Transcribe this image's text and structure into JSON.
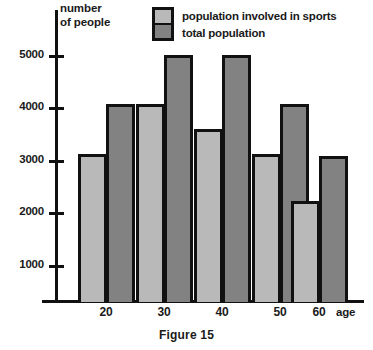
{
  "chart_data": {
    "type": "bar",
    "title": "",
    "caption": "Figure 15",
    "xlabel": "age",
    "ylabel": "number\nof people",
    "ylabel_line1": "number",
    "ylabel_line2": "of people",
    "categories": [
      "20",
      "30",
      "40",
      "50",
      "60"
    ],
    "yticks": [
      "1000",
      "2000",
      "3000",
      "4000",
      "5000"
    ],
    "ylim": [
      0,
      5600
    ],
    "grid": false,
    "legend_position": "top-center",
    "series": [
      {
        "name": "population involved in sports",
        "color": "#b9b9b9",
        "values": [
          3000,
          4000,
          3500,
          3000,
          2050
        ]
      },
      {
        "name": "total population",
        "color": "#828282",
        "values": [
          4000,
          5000,
          5000,
          4000,
          2950
        ]
      }
    ]
  },
  "legend": {
    "items": [
      {
        "label": "population involved in sports",
        "swatch": "light-gray"
      },
      {
        "label": "total population",
        "swatch": "dark-gray"
      }
    ]
  },
  "axes": {
    "y_title_line1": "number",
    "y_title_line2": "of people",
    "x_title": "age",
    "y_tick_labels": [
      "5000",
      "4000",
      "3000",
      "2000",
      "1000"
    ],
    "x_tick_labels": [
      "20",
      "30",
      "40",
      "50",
      "60"
    ]
  },
  "caption": {
    "text": "Figure 15"
  },
  "colors": {
    "sports_fill": "#b9b9b9",
    "total_fill": "#828282",
    "outline": "#111111",
    "background": "#ffffff"
  }
}
